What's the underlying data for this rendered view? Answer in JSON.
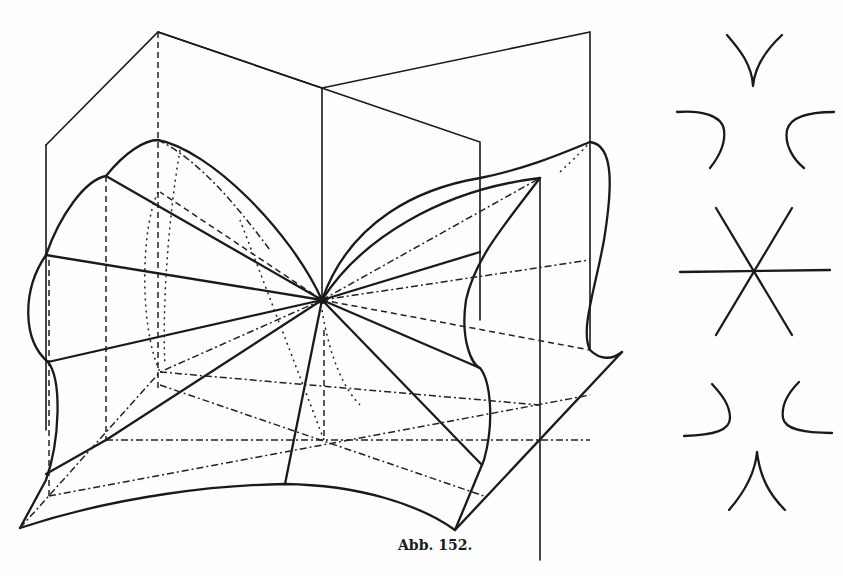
{
  "figure": {
    "caption": "Abb. 152.",
    "main_diagram": "perspective-sketch-of-surface-with-two-intersecting-planes",
    "side_sequence": [
      {
        "id": "section-1",
        "shape": "cusp-opening-upward"
      },
      {
        "id": "section-2",
        "shape": "pair-of-curves-hyperbola-like-upper"
      },
      {
        "id": "section-3",
        "shape": "three-lines-through-point"
      },
      {
        "id": "section-4",
        "shape": "pair-of-curves-hyperbola-like-lower"
      },
      {
        "id": "section-5",
        "shape": "cusp-opening-downward"
      }
    ]
  },
  "colors": {
    "ink": "#1a1a1a",
    "paper": "#fefefe",
    "bleed_through_text": "#d8d8d8"
  },
  "background_text": {
    "lines": [
      "                                   ⟨I⟩ ⟨mit⟩  ",
      "                                                                          ",
      "seiten gallie                                                                         ",
      "     und                   ⟨ganz⟩ ⟨analog⟩  ⟨ist⟩               ",
      "     ⟨vertikal⟩      ⟨sich⟩  ⟨kritisch⟩  ⟨W⟩               ",
      "                 ⟨Achsen⟩    ⟨hat⟩                               ",
      "                                                                    ",
      "                                                                    ",
      "                                                                    ",
      "                                                                    ",
      "                                                                    ",
      "                                                                    ",
      "                                                                    ",
      "                                                                    ",
      "                                                                    ",
      "                                                                    ",
      "                                                                    ",
      "                                                                    ",
      "                                                                    ",
      "                                                                    ",
      "                                                                    ",
      "                                                                    ",
      "                                                                    "
    ]
  }
}
